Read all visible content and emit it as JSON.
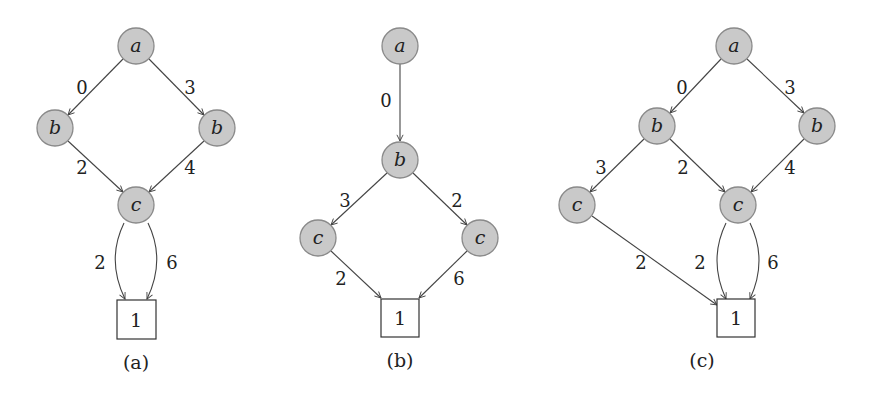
{
  "figures": [
    {
      "caption": "(a)",
      "nodes": [
        {
          "id": "a",
          "label": "a",
          "x": 136,
          "y": 46
        },
        {
          "id": "b1",
          "label": "b",
          "x": 55,
          "y": 128
        },
        {
          "id": "b2",
          "label": "b",
          "x": 217,
          "y": 128
        },
        {
          "id": "c",
          "label": "c",
          "x": 136,
          "y": 205
        }
      ],
      "leaf": {
        "label": "1",
        "x": 136,
        "y": 320
      },
      "edges": [
        {
          "from": "a",
          "to": "b1",
          "label": "0"
        },
        {
          "from": "a",
          "to": "b2",
          "label": "3"
        },
        {
          "from": "b1",
          "to": "c",
          "label": "2"
        },
        {
          "from": "b2",
          "to": "c",
          "label": "4"
        },
        {
          "from": "c",
          "to": "1",
          "label": "2"
        },
        {
          "from": "c",
          "to": "1",
          "label": "6"
        }
      ]
    },
    {
      "caption": "(b)",
      "nodes": [
        {
          "id": "a",
          "label": "a",
          "x": 400,
          "y": 46
        },
        {
          "id": "b",
          "label": "b",
          "x": 400,
          "y": 160
        },
        {
          "id": "c1",
          "label": "c",
          "x": 318,
          "y": 238
        },
        {
          "id": "c2",
          "label": "c",
          "x": 480,
          "y": 238
        }
      ],
      "leaf": {
        "label": "1",
        "x": 400,
        "y": 318
      },
      "edges": [
        {
          "from": "a",
          "to": "b",
          "label": "0"
        },
        {
          "from": "b",
          "to": "c1",
          "label": "3"
        },
        {
          "from": "b",
          "to": "c2",
          "label": "2"
        },
        {
          "from": "c1",
          "to": "1",
          "label": "2"
        },
        {
          "from": "c2",
          "to": "1",
          "label": "6"
        }
      ]
    },
    {
      "caption": "(c)",
      "nodes": [
        {
          "id": "a",
          "label": "a",
          "x": 734,
          "y": 46
        },
        {
          "id": "b1",
          "label": "b",
          "x": 657,
          "y": 126
        },
        {
          "id": "b2",
          "label": "b",
          "x": 817,
          "y": 126
        },
        {
          "id": "c1",
          "label": "c",
          "x": 577,
          "y": 205
        },
        {
          "id": "c2",
          "label": "c",
          "x": 738,
          "y": 205
        }
      ],
      "leaf": {
        "label": "1",
        "x": 736,
        "y": 318
      },
      "edges": [
        {
          "from": "a",
          "to": "b1",
          "label": "0"
        },
        {
          "from": "a",
          "to": "b2",
          "label": "3"
        },
        {
          "from": "b1",
          "to": "c1",
          "label": "3"
        },
        {
          "from": "b1",
          "to": "c2",
          "label": "2"
        },
        {
          "from": "b2",
          "to": "c2",
          "label": "4"
        },
        {
          "from": "c1",
          "to": "1",
          "label": "2"
        },
        {
          "from": "c2",
          "to": "1",
          "label": "2"
        },
        {
          "from": "c2",
          "to": "1",
          "label": "6"
        }
      ]
    }
  ]
}
